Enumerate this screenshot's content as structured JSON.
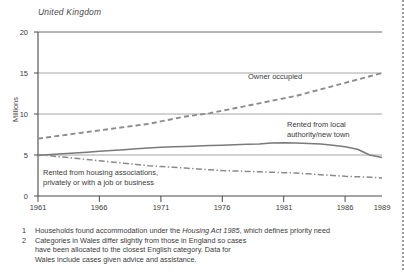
{
  "figure": {
    "region_title": "United Kingdom",
    "page_edge_icon": "page-edge-dotted-rule"
  },
  "chart_data": {
    "type": "line",
    "title": "United Kingdom",
    "xlabel": "",
    "ylabel": "Millions",
    "xlim": [
      1961,
      1989
    ],
    "ylim": [
      0,
      20
    ],
    "grid": true,
    "legend_position": "inline-annotations",
    "x": [
      1961,
      1962,
      1963,
      1964,
      1965,
      1966,
      1967,
      1968,
      1969,
      1970,
      1971,
      1972,
      1973,
      1974,
      1975,
      1976,
      1977,
      1978,
      1979,
      1980,
      1981,
      1982,
      1983,
      1984,
      1985,
      1986,
      1987,
      1988,
      1989
    ],
    "yticks": [
      0,
      5,
      10,
      15,
      20
    ],
    "xticks": [
      1961,
      1966,
      1971,
      1976,
      1981,
      1986,
      1989
    ],
    "xtick_labels": [
      "1961",
      "1966",
      "1971",
      "1976",
      "1981",
      "1986",
      "1989"
    ],
    "ytick_labels": [
      "0",
      "5",
      "10",
      "15",
      "20"
    ],
    "series": [
      {
        "name": "Owner occupied",
        "style": "dashed",
        "color": "#8c8c8c",
        "values": [
          7.0,
          7.2,
          7.4,
          7.6,
          7.8,
          8.0,
          8.2,
          8.4,
          8.6,
          8.8,
          9.1,
          9.4,
          9.7,
          9.9,
          10.1,
          10.4,
          10.7,
          11.0,
          11.3,
          11.6,
          11.9,
          12.2,
          12.6,
          13.0,
          13.4,
          13.8,
          14.2,
          14.6,
          15.0
        ]
      },
      {
        "name": "Rented from local authority/new town",
        "style": "solid",
        "color": "#7a7a7a",
        "values": [
          4.95,
          5.05,
          5.15,
          5.25,
          5.35,
          5.45,
          5.55,
          5.65,
          5.75,
          5.85,
          5.95,
          6.0,
          6.05,
          6.1,
          6.15,
          6.2,
          6.25,
          6.3,
          6.35,
          6.45,
          6.5,
          6.45,
          6.4,
          6.35,
          6.2,
          6.0,
          5.7,
          5.0,
          4.7
        ]
      },
      {
        "name": "Rented from housing associations, privately or with a job or business",
        "style": "dash-dot",
        "color": "#8a8a8a",
        "values": [
          5.05,
          4.9,
          4.75,
          4.6,
          4.45,
          4.3,
          4.15,
          4.0,
          3.85,
          3.7,
          3.6,
          3.5,
          3.4,
          3.3,
          3.2,
          3.1,
          3.05,
          3.0,
          2.95,
          2.9,
          2.85,
          2.8,
          2.7,
          2.6,
          2.5,
          2.4,
          2.35,
          2.3,
          2.2
        ]
      }
    ],
    "annotations": [
      {
        "id": "owner-occupied",
        "text": "Owner occupied"
      },
      {
        "id": "rented-local-authority",
        "text": "Rented from local\nauthority/new town"
      },
      {
        "id": "rented-housing-associations",
        "text": "Rented from housing associations,\nprivately or with a job or business"
      }
    ]
  },
  "footnotes": [
    {
      "marker": "1",
      "text_before_italic": "Households found accommodation under the ",
      "italic": "Housing Act 1985",
      "text_after_italic": ", which defines priority need"
    },
    {
      "marker": "2",
      "text": "Categories in Wales differ slightly from those in England so cases\nhave been allocated to the closest English category. Data for\nWales include cases given advice and assistance."
    }
  ]
}
